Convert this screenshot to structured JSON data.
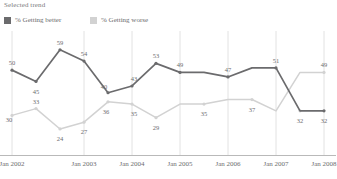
{
  "header": {
    "title": "Selected trend"
  },
  "legend": {
    "position": "top-left",
    "items": [
      {
        "label": "% Getting better",
        "color": "#6b6b6d",
        "key": "better"
      },
      {
        "label": "% Getting worse",
        "color": "#d2d2d2",
        "key": "worse"
      }
    ]
  },
  "axis": {
    "ticks": [
      "Jan 2002",
      "Jan 2003",
      "Jan 2004",
      "Jan 2005",
      "Jan 2006",
      "Jan 2007",
      "Jan 2008"
    ]
  },
  "chart_data": {
    "type": "line",
    "title": "Selected trend",
    "xlabel": "",
    "ylabel": "",
    "ylim": [
      20,
      62
    ],
    "grid": "vertical",
    "legend_position": "top-left",
    "x": [
      "Jan 2002",
      "Mar 2002",
      "Jul 2002",
      "Jan 2003",
      "Jul 2003",
      "Jan 2004",
      "Jul 2004",
      "Jan 2005",
      "Jul 2005",
      "Jan 2006",
      "Jul 2006",
      "Jan 2007",
      "Jul 2007",
      "Jan 2008"
    ],
    "series": [
      {
        "name": "% Getting better",
        "color": "#6b6b6d",
        "values": [
          50,
          45,
          59,
          54,
          40,
          43,
          53,
          49,
          49,
          47,
          51,
          51,
          32,
          32
        ],
        "labeled_points": [
          {
            "x": 0,
            "value": 50
          },
          {
            "x": 1,
            "value": 45
          },
          {
            "x": 2,
            "value": 59
          },
          {
            "x": 3,
            "value": 54
          },
          {
            "x": 4,
            "value": 40
          },
          {
            "x": 5,
            "value": 43
          },
          {
            "x": 6,
            "value": 53
          },
          {
            "x": 7,
            "value": 49
          },
          {
            "x": 9,
            "value": 47
          },
          {
            "x": 11,
            "value": 51
          },
          {
            "x": 13,
            "value": 32
          }
        ]
      },
      {
        "name": "% Getting worse",
        "color": "#d2d2d2",
        "values": [
          30,
          33,
          24,
          27,
          36,
          35,
          29,
          35,
          35,
          37,
          37,
          32,
          49,
          49
        ],
        "labeled_points": [
          {
            "x": 0,
            "value": 30
          },
          {
            "x": 1,
            "value": 33
          },
          {
            "x": 2,
            "value": 24
          },
          {
            "x": 3,
            "value": 27
          },
          {
            "x": 4,
            "value": 36
          },
          {
            "x": 5,
            "value": 35
          },
          {
            "x": 6,
            "value": 29
          },
          {
            "x": 8,
            "value": 35
          },
          {
            "x": 10,
            "value": 37
          },
          {
            "x": 12,
            "value": 32
          },
          {
            "x": 13,
            "value": 49
          }
        ]
      }
    ]
  }
}
